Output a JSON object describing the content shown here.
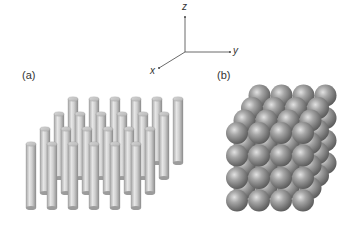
{
  "axes": {
    "z_label": "z",
    "y_label": "y",
    "x_label": "x"
  },
  "panels": {
    "a": {
      "label": "(a)",
      "description": "array of vertical cylinders (nanowires)",
      "rows": 4,
      "cols_per_row": [
        6,
        6,
        6,
        6
      ]
    },
    "b": {
      "label": "(b)",
      "description": "cubic packing of spheres",
      "grid": [
        4,
        4,
        4
      ]
    }
  },
  "colors": {
    "background": "#ffffff",
    "cylinder_light": "#e0e0e0",
    "cylinder_dark": "#9a9a9a",
    "sphere_light": "#d8d8d8",
    "sphere_dark": "#5e5e5e",
    "axis": "#444444"
  }
}
